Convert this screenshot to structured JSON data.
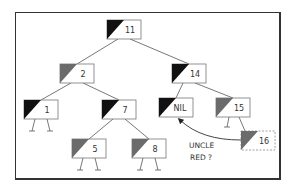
{
  "diagram": {
    "type": "red-black-tree",
    "colors": {
      "black": "#111111",
      "red": "#6b6b6b",
      "edge": "#555555",
      "box_border": "#777777",
      "text": "#333333"
    },
    "nodes": [
      {
        "id": "n11",
        "label": "11",
        "color": "black",
        "x": 107,
        "y": 20,
        "leaves": false
      },
      {
        "id": "n2",
        "label": "2",
        "color": "red",
        "x": 60,
        "y": 64,
        "leaves": false
      },
      {
        "id": "n14",
        "label": "14",
        "color": "black",
        "x": 172,
        "y": 64,
        "leaves": false
      },
      {
        "id": "n1",
        "label": "1",
        "color": "black",
        "x": 24,
        "y": 100,
        "leaves": true
      },
      {
        "id": "n7",
        "label": "7",
        "color": "black",
        "x": 102,
        "y": 100,
        "leaves": false
      },
      {
        "id": "nNIL",
        "label": "NIL",
        "color": "black",
        "x": 159,
        "y": 98,
        "leaves": false
      },
      {
        "id": "n15",
        "label": "15",
        "color": "red",
        "x": 216,
        "y": 98,
        "leaves": "left"
      },
      {
        "id": "n5",
        "label": "5",
        "color": "red",
        "x": 72,
        "y": 139,
        "leaves": true
      },
      {
        "id": "n8",
        "label": "8",
        "color": "red",
        "x": 132,
        "y": 139,
        "leaves": true
      },
      {
        "id": "n16",
        "label": "16",
        "color": "red",
        "x": 241,
        "y": 131,
        "leaves": false,
        "dashed": true
      }
    ],
    "edges": [
      [
        "n11",
        "n2"
      ],
      [
        "n11",
        "n14"
      ],
      [
        "n2",
        "n1"
      ],
      [
        "n2",
        "n7"
      ],
      [
        "n7",
        "n5"
      ],
      [
        "n7",
        "n8"
      ],
      [
        "n14",
        "nNIL"
      ],
      [
        "n14",
        "n15"
      ],
      [
        "n15",
        "n16"
      ]
    ],
    "annotation": {
      "line1": "UNCLE",
      "line2": "RED ?",
      "arrow_from": "n16",
      "arrow_to": "nNIL"
    }
  }
}
